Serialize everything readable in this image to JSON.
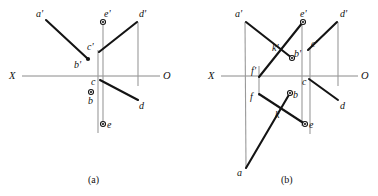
{
  "figure": {
    "width": 378,
    "height": 196,
    "background": "#ffffff",
    "ink_color": "#141414",
    "axis_color": "#8a8a8a",
    "projector_color": "#9a9a9a"
  },
  "captions": [
    {
      "text": "(a)",
      "x": 88,
      "y": 175
    },
    {
      "text": "(b)",
      "x": 281,
      "y": 175
    }
  ],
  "panels": [
    {
      "id": "panel-a",
      "caption": "(a)",
      "axis": {
        "y": 76,
        "x_start": 22,
        "x_end": 160,
        "left_label": "X",
        "right_label": "O",
        "left_label_x": 9,
        "right_label_x": 163,
        "label_y": 71
      },
      "projectors": [
        {
          "name": "projector-e",
          "x1": 103,
          "y1": 22,
          "x2": 103,
          "y2": 124
        },
        {
          "name": "projector-c",
          "x1": 98,
          "y1": 50,
          "x2": 98,
          "y2": 133
        },
        {
          "name": "projector-d",
          "x1": 138,
          "y1": 22,
          "x2": 138,
          "y2": 86
        }
      ],
      "edges": [
        {
          "name": "edge-a-prime-b-prime",
          "x1": 46,
          "y1": 20,
          "x2": 88,
          "y2": 59
        },
        {
          "name": "edge-c-prime-d-prime",
          "x1": 99,
          "y1": 52,
          "x2": 137,
          "y2": 22
        },
        {
          "name": "edge-c-d",
          "x1": 100,
          "y1": 80,
          "x2": 138,
          "y2": 100
        }
      ],
      "points": [
        {
          "name": "point-a-prime",
          "label": "a'",
          "x": 46,
          "y": 20,
          "marker": "none",
          "label_x": 36,
          "label_y": 9
        },
        {
          "name": "point-b-prime",
          "label": "b'",
          "x": 88,
          "y": 59,
          "marker": "filled",
          "label_x": 74,
          "label_y": 60
        },
        {
          "name": "point-c-prime",
          "label": "c'",
          "x": 99,
          "y": 51,
          "marker": "none",
          "label_x": 87,
          "label_y": 42
        },
        {
          "name": "point-d-prime",
          "label": "d'",
          "x": 138,
          "y": 22,
          "marker": "none",
          "label_x": 139,
          "label_y": 9
        },
        {
          "name": "point-e-prime",
          "label": "e'",
          "x": 103,
          "y": 22,
          "marker": "ring",
          "label_x": 104,
          "label_y": 9
        },
        {
          "name": "point-b",
          "label": "b",
          "x": 91,
          "y": 92,
          "marker": "ring",
          "label_x": 88,
          "label_y": 96
        },
        {
          "name": "point-c",
          "label": "c",
          "x": 99,
          "y": 79,
          "marker": "none",
          "label_x": 91,
          "label_y": 77
        },
        {
          "name": "point-d",
          "label": "d",
          "x": 138,
          "y": 100,
          "marker": "none",
          "label_x": 139,
          "label_y": 101
        },
        {
          "name": "point-e",
          "label": "e",
          "x": 103,
          "y": 124,
          "marker": "ring",
          "label_x": 107,
          "label_y": 120
        }
      ]
    },
    {
      "id": "panel-b",
      "caption": "(b)",
      "axis": {
        "y": 76,
        "x_start": 221,
        "x_end": 358,
        "left_label": "X",
        "right_label": "O",
        "left_label_x": 208,
        "right_label_x": 361,
        "label_y": 71
      },
      "projectors": [
        {
          "name": "projector-a",
          "x1": 245,
          "y1": 22,
          "x2": 246,
          "y2": 168
        },
        {
          "name": "projector-f",
          "x1": 259,
          "y1": 66,
          "x2": 259,
          "y2": 96
        },
        {
          "name": "projector-e",
          "x1": 302,
          "y1": 22,
          "x2": 302,
          "y2": 126
        },
        {
          "name": "projector-c",
          "x1": 310,
          "y1": 48,
          "x2": 310,
          "y2": 134
        },
        {
          "name": "projector-d",
          "x1": 338,
          "y1": 22,
          "x2": 338,
          "y2": 86
        }
      ],
      "edges": [
        {
          "name": "edge-a-prime-b-prime",
          "x1": 246,
          "y1": 22,
          "x2": 292,
          "y2": 58
        },
        {
          "name": "edge-f-prime-e-prime",
          "x1": 259,
          "y1": 77,
          "x2": 303,
          "y2": 22
        },
        {
          "name": "edge-c-prime-d-prime",
          "x1": 308,
          "y1": 50,
          "x2": 337,
          "y2": 22
        },
        {
          "name": "edge-c-d",
          "x1": 309,
          "y1": 79,
          "x2": 338,
          "y2": 100
        },
        {
          "name": "edge-f-e",
          "x1": 259,
          "y1": 94,
          "x2": 305,
          "y2": 124
        },
        {
          "name": "edge-a-b",
          "x1": 246,
          "y1": 168,
          "x2": 290,
          "y2": 93
        }
      ],
      "points": [
        {
          "name": "point-a-prime",
          "label": "a'",
          "x": 246,
          "y": 22,
          "marker": "none",
          "label_x": 235,
          "label_y": 9
        },
        {
          "name": "point-k-prime",
          "label": "k'",
          "x": 281,
          "y": 55,
          "marker": "none",
          "label_x": 272,
          "label_y": 43
        },
        {
          "name": "point-b-prime",
          "label": "b'",
          "x": 292,
          "y": 58,
          "marker": "ring",
          "label_x": 294,
          "label_y": 49
        },
        {
          "name": "point-c-prime",
          "label": "c'",
          "x": 309,
          "y": 49,
          "marker": "none",
          "label_x": 311,
          "label_y": 39
        },
        {
          "name": "point-e-prime",
          "label": "e'",
          "x": 303,
          "y": 22,
          "marker": "ring",
          "label_x": 300,
          "label_y": 9
        },
        {
          "name": "point-d-prime",
          "label": "d'",
          "x": 338,
          "y": 22,
          "marker": "none",
          "label_x": 340,
          "label_y": 9
        },
        {
          "name": "point-f-prime",
          "label": "f'",
          "x": 259,
          "y": 77,
          "marker": "none",
          "label_x": 251,
          "label_y": 66
        },
        {
          "name": "point-f",
          "label": "f",
          "x": 259,
          "y": 94,
          "marker": "none",
          "label_x": 250,
          "label_y": 92
        },
        {
          "name": "point-c",
          "label": "c",
          "x": 310,
          "y": 79,
          "marker": "none",
          "label_x": 302,
          "label_y": 77
        },
        {
          "name": "point-b",
          "label": "b",
          "x": 290,
          "y": 93,
          "marker": "ring",
          "label_x": 293,
          "label_y": 90
        },
        {
          "name": "point-k",
          "label": "k",
          "x": 281,
          "y": 106,
          "marker": "none",
          "label_x": 275,
          "label_y": 110
        },
        {
          "name": "point-e",
          "label": "e",
          "x": 305,
          "y": 124,
          "marker": "ring",
          "label_x": 309,
          "label_y": 120
        },
        {
          "name": "point-d",
          "label": "d",
          "x": 338,
          "y": 100,
          "marker": "none",
          "label_x": 340,
          "label_y": 101
        },
        {
          "name": "point-a",
          "label": "a",
          "x": 246,
          "y": 168,
          "marker": "none",
          "label_x": 237,
          "label_y": 168
        }
      ]
    }
  ]
}
